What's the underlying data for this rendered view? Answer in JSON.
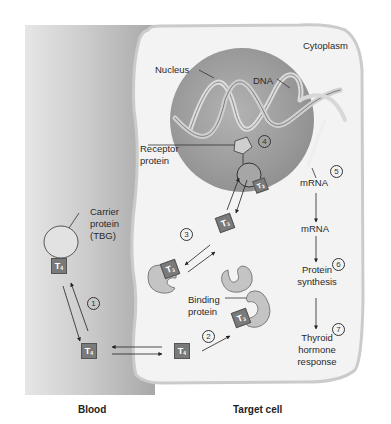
{
  "diagram": {
    "regions": {
      "blood": "Blood",
      "target_cell": "Target cell",
      "cytoplasm": "Cytoplasm"
    },
    "labels": {
      "nucleus": "Nucleus",
      "dna": "DNA",
      "receptor_protein_1": "Receptor",
      "receptor_protein_2": "protein",
      "mrna_nuclear": "mRNA",
      "mrna_cyto": "mRNA",
      "carrier_1": "Carrier",
      "carrier_2": "protein",
      "carrier_3": "(TBG)",
      "binding_1": "Binding",
      "binding_2": "protein",
      "protein_synthesis_1": "Protein",
      "protein_synthesis_2": "synthesis",
      "response_1": "Thyroid",
      "response_2": "hormone",
      "response_3": "response"
    },
    "hormones": {
      "t4": "T",
      "t4_sub": "4",
      "t3": "T",
      "t3_sub": "3"
    },
    "steps": [
      "1",
      "2",
      "3",
      "4",
      "5",
      "6",
      "7"
    ],
    "colors": {
      "blood_gradient_dark": "#a9a9a9",
      "blood_gradient_light": "#e4e4e4",
      "cell_fill": "#f2f2f2",
      "cell_border": "#cfcfcf",
      "nucleus_fill": "#9a9a9a",
      "hormone_box": "#7a7a7a",
      "binding_protein": "#c4c4c4"
    }
  }
}
